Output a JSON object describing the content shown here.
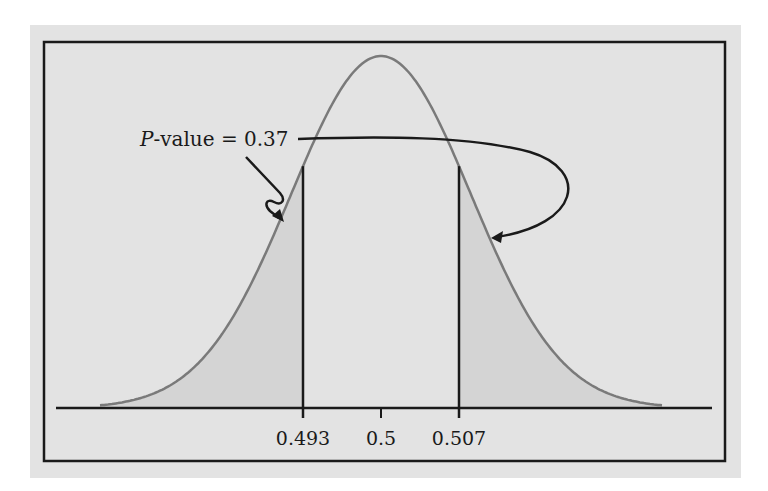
{
  "chart_data": {
    "type": "area",
    "title": "",
    "distribution": "normal",
    "mean": 0.5,
    "xlabel": "",
    "ylabel": "",
    "x_ticks": [
      {
        "value": 0.493,
        "label": "0.493"
      },
      {
        "value": 0.5,
        "label": "0.5"
      },
      {
        "value": 0.507,
        "label": "0.507"
      }
    ],
    "shaded_regions": [
      {
        "name": "left-tail",
        "from": null,
        "to": 0.493
      },
      {
        "name": "right-tail",
        "from": 0.507,
        "to": null
      }
    ],
    "annotation": {
      "prefix": "P",
      "text": "-value = 0.37",
      "p_value": 0.37,
      "points_to": [
        "left-tail",
        "right-tail"
      ]
    },
    "grid": false,
    "legend": null
  },
  "colors": {
    "page_background": "#ffffff",
    "panel_background": "#e3e3e3",
    "shaded_tail": "#d4d4d4",
    "curve": "#7a7a7a",
    "lines": "#1a1a1a"
  }
}
